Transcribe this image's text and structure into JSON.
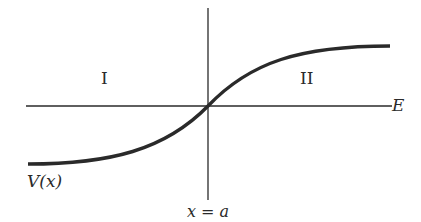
{
  "diagram": {
    "region_left_label": "I",
    "region_right_label": "II",
    "horizontal_axis_label": "E",
    "curve_label": "V(x)",
    "vertical_line_label": "x = a",
    "colors": {
      "ink": "#2a2a2a",
      "background": "#ffffff"
    }
  }
}
